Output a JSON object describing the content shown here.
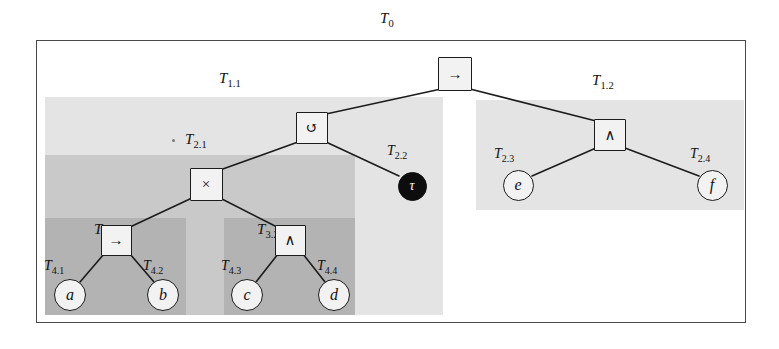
{
  "diagram": {
    "title": "T0",
    "title_label": {
      "base": "T",
      "sub": "0"
    },
    "colors": {
      "outer_border": "#4a4a4a",
      "region_t1_1": "#e4e4e4",
      "region_t1_2": "#e4e4e4",
      "region_t2_1": "#c9c9c9",
      "region_t3_1": "#b3b3b3",
      "region_t3_2": "#b3b3b3",
      "node_fill": "#f2f2f2",
      "node_stroke": "#1c1c1c",
      "filled_node": "#0d0d0d",
      "edge": "#1c1c1c",
      "text": "#111111"
    },
    "regions": [
      {
        "id": "T0",
        "base": "T",
        "sub": "0",
        "shade": "white",
        "x": 36,
        "y": 40,
        "w": 710,
        "h": 283
      },
      {
        "id": "T1.1",
        "base": "T",
        "sub": "1.1",
        "shade": "light",
        "x": 45,
        "y": 97,
        "w": 398,
        "h": 218
      },
      {
        "id": "T1.2",
        "base": "T",
        "sub": "1.2",
        "shade": "light",
        "x": 476,
        "y": 100,
        "w": 268,
        "h": 110
      },
      {
        "id": "T2.1",
        "base": "T",
        "sub": "2.1",
        "shade": "medium",
        "x": 45,
        "y": 155,
        "w": 310,
        "h": 160
      },
      {
        "id": "T3.1",
        "base": "T",
        "sub": "3.1",
        "shade": "dark",
        "x": 45,
        "y": 218,
        "w": 141,
        "h": 97
      },
      {
        "id": "T3.2",
        "base": "T",
        "sub": "3.2",
        "shade": "dark",
        "x": 224,
        "y": 218,
        "w": 131,
        "h": 97
      }
    ],
    "region_captions": [
      {
        "id": "T0",
        "base": "T",
        "sub": "0",
        "x": 380,
        "y": 10
      },
      {
        "id": "T1.1",
        "base": "T",
        "sub": "1.1",
        "x": 219,
        "y": 70
      },
      {
        "id": "T1.2",
        "base": "T",
        "sub": "1.2",
        "x": 592,
        "y": 72
      },
      {
        "id": "T2.1",
        "base": "T",
        "sub": "2.1",
        "x": 185,
        "y": 131
      },
      {
        "id": "T3.1",
        "base": "T",
        "sub": "3.1",
        "x": 94,
        "y": 221
      },
      {
        "id": "T3.2",
        "base": "T",
        "sub": "3.2",
        "x": 257,
        "y": 221
      }
    ],
    "nodes": [
      {
        "id": "root",
        "label": "T0",
        "glyph": "→",
        "shape": "square",
        "fill": "light",
        "cx": 455,
        "cy": 74,
        "size": 34
      },
      {
        "id": "loop",
        "label": "",
        "glyph": "↺",
        "shape": "square",
        "fill": "light",
        "cx": 312,
        "cy": 128,
        "size": 32
      },
      {
        "id": "times",
        "label": "T2.1",
        "glyph": "×",
        "shape": "square",
        "fill": "light",
        "cx": 206,
        "cy": 184,
        "size": 33
      },
      {
        "id": "tau",
        "label": "T2.2",
        "glyph": "τ",
        "shape": "circle",
        "fill": "black",
        "cx": 412,
        "cy": 186,
        "size": 29
      },
      {
        "id": "impl2",
        "label": "T3.1",
        "glyph": "→",
        "shape": "square",
        "fill": "light",
        "cx": 116,
        "cy": 240,
        "size": 31
      },
      {
        "id": "and1",
        "label": "T3.2",
        "glyph": "∧",
        "shape": "square",
        "fill": "light",
        "cx": 290,
        "cy": 240,
        "size": 31
      },
      {
        "id": "a",
        "label": "T4.1",
        "glyph": "a",
        "shape": "circle",
        "fill": "light",
        "cx": 70,
        "cy": 295,
        "size": 32
      },
      {
        "id": "b",
        "label": "T4.2",
        "glyph": "b",
        "shape": "circle",
        "fill": "light",
        "cx": 163,
        "cy": 295,
        "size": 32
      },
      {
        "id": "c",
        "label": "T4.3",
        "glyph": "c",
        "shape": "circle",
        "fill": "light",
        "cx": 247,
        "cy": 295,
        "size": 32
      },
      {
        "id": "d",
        "label": "T4.4",
        "glyph": "d",
        "shape": "circle",
        "fill": "light",
        "cx": 334,
        "cy": 295,
        "size": 32
      },
      {
        "id": "and2",
        "label": "",
        "glyph": "∧",
        "shape": "square",
        "fill": "light",
        "cx": 610,
        "cy": 135,
        "size": 32
      },
      {
        "id": "e",
        "label": "T2.3",
        "glyph": "e",
        "shape": "circle",
        "fill": "light",
        "cx": 518,
        "cy": 185,
        "size": 31
      },
      {
        "id": "f",
        "label": "T2.4",
        "glyph": "f",
        "shape": "circle",
        "fill": "light",
        "cx": 712,
        "cy": 185,
        "size": 31
      }
    ],
    "node_captions": [
      {
        "id": "T2.2",
        "base": "T",
        "sub": "2.2",
        "x": 387,
        "y": 143
      },
      {
        "id": "T4.1",
        "base": "T",
        "sub": "4.1",
        "x": 44,
        "y": 258
      },
      {
        "id": "T4.2",
        "base": "T",
        "sub": "4.2",
        "x": 143,
        "y": 258
      },
      {
        "id": "T4.3",
        "base": "T",
        "sub": "4.3",
        "x": 221,
        "y": 258
      },
      {
        "id": "T4.4",
        "base": "T",
        "sub": "4.4",
        "x": 317,
        "y": 258
      },
      {
        "id": "T2.3",
        "base": "T",
        "sub": "2.3",
        "x": 494,
        "y": 146
      },
      {
        "id": "T2.4",
        "base": "T",
        "sub": "2.4",
        "x": 690,
        "y": 146
      }
    ],
    "edges": [
      {
        "from": "root",
        "to": "loop",
        "x1": 441,
        "y1": 89,
        "x2": 326,
        "y2": 114
      },
      {
        "from": "root",
        "to": "and2",
        "x1": 470,
        "y1": 89,
        "x2": 596,
        "y2": 121
      },
      {
        "from": "loop",
        "to": "times",
        "x1": 298,
        "y1": 142,
        "x2": 220,
        "y2": 170
      },
      {
        "from": "loop",
        "to": "tau",
        "x1": 326,
        "y1": 142,
        "x2": 399,
        "y2": 176
      },
      {
        "from": "times",
        "to": "impl2",
        "x1": 192,
        "y1": 198,
        "x2": 130,
        "y2": 227
      },
      {
        "from": "times",
        "to": "and1",
        "x1": 220,
        "y1": 198,
        "x2": 277,
        "y2": 227
      },
      {
        "from": "impl2",
        "to": "a",
        "x1": 104,
        "y1": 254,
        "x2": 80,
        "y2": 282
      },
      {
        "from": "impl2",
        "to": "b",
        "x1": 130,
        "y1": 254,
        "x2": 154,
        "y2": 282
      },
      {
        "from": "and1",
        "to": "c",
        "x1": 278,
        "y1": 254,
        "x2": 256,
        "y2": 282
      },
      {
        "from": "and1",
        "to": "d",
        "x1": 303,
        "y1": 254,
        "x2": 325,
        "y2": 282
      },
      {
        "from": "and2",
        "to": "e",
        "x1": 596,
        "y1": 148,
        "x2": 532,
        "y2": 176
      },
      {
        "from": "and2",
        "to": "f",
        "x1": 625,
        "y1": 148,
        "x2": 699,
        "y2": 176
      }
    ]
  }
}
